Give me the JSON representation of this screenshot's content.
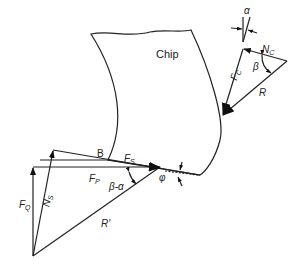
{
  "figure": {
    "labels": {
      "chip": "Chip",
      "point_b": "B",
      "shear_force": "F",
      "shear_force_sub": "S",
      "normal_shear": "N",
      "normal_shear_sub": "S",
      "cutting_force": "F",
      "cutting_force_sub": "P",
      "thrust_force": "F",
      "thrust_force_sub": "Q",
      "resultant_prime": "R'",
      "resultant": "R",
      "friction_force": "F",
      "friction_force_sub": "C",
      "normal_chip": "N",
      "normal_chip_sub": "C",
      "beta_minus_alpha": "β-α",
      "beta": "β",
      "phi": "φ",
      "alpha": "α"
    }
  }
}
